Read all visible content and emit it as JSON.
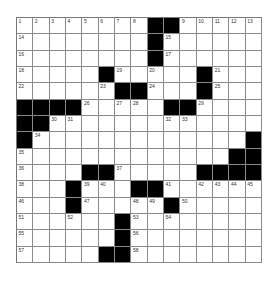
{
  "puzzle": {
    "rows": 15,
    "cols": 15,
    "colors": {
      "block": "#000000",
      "cell": "#ffffff",
      "gridline": "#8a8a8a",
      "number": "#333333"
    },
    "grid": [
      [
        "1",
        "2",
        "3",
        "4",
        "5",
        "6",
        "7",
        "8",
        "#",
        "#",
        "9",
        "10",
        "11",
        "12",
        "13"
      ],
      [
        "14",
        "",
        "",
        "",
        "",
        "",
        "",
        "",
        "#",
        "15",
        "",
        "",
        "",
        "",
        ""
      ],
      [
        "16",
        "",
        "",
        "",
        "",
        "",
        "",
        "",
        "#",
        "17",
        "",
        "",
        "",
        "",
        ""
      ],
      [
        "18",
        "",
        "",
        "",
        "",
        "#",
        "19",
        "",
        "20",
        "",
        "",
        "#",
        "21",
        "",
        ""
      ],
      [
        "22",
        "",
        "",
        "",
        "",
        "23",
        "#",
        "#",
        "24",
        "",
        "",
        "#",
        "25",
        "",
        ""
      ],
      [
        "#",
        "#",
        "#",
        "#",
        "26",
        "",
        "27",
        "28",
        "",
        "#",
        "#",
        "29",
        "",
        "",
        ""
      ],
      [
        "#",
        "#",
        "30",
        "31",
        "",
        "",
        "",
        "",
        "",
        "32",
        "33",
        "",
        "",
        "",
        ""
      ],
      [
        "#",
        "34",
        "",
        "",
        "",
        "",
        "",
        "",
        "",
        "",
        "",
        "",
        "",
        "",
        "#"
      ],
      [
        "35",
        "",
        "",
        "",
        "",
        "",
        "",
        "",
        "",
        "",
        "",
        "",
        "",
        "#",
        "#"
      ],
      [
        "36",
        "",
        "",
        "",
        "#",
        "#",
        "37",
        "",
        "",
        "",
        "",
        "#",
        "#",
        "#",
        "#"
      ],
      [
        "38",
        "",
        "",
        "#",
        "39",
        "40",
        "",
        "#",
        "#",
        "41",
        "",
        "42",
        "43",
        "44",
        "45"
      ],
      [
        "46",
        "",
        "",
        "#",
        "47",
        "",
        "",
        "48",
        "49",
        "#",
        "50",
        "",
        "",
        "",
        ""
      ],
      [
        "51",
        "",
        "",
        "52",
        "",
        "",
        "#",
        "53",
        "",
        "54",
        "",
        "",
        "",
        "",
        ""
      ],
      [
        "55",
        "",
        "",
        "",
        "",
        "",
        "#",
        "56",
        "",
        "",
        "",
        "",
        "",
        "",
        ""
      ],
      [
        "57",
        "",
        "",
        "",
        "",
        "#",
        "#",
        "58",
        "",
        "",
        "",
        "",
        "",
        "",
        ""
      ]
    ]
  }
}
